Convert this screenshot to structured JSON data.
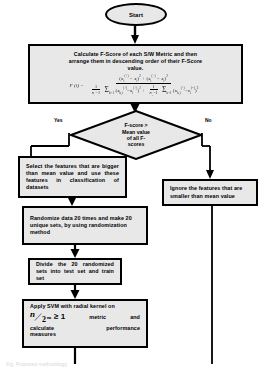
{
  "diagram": {
    "colors": {
      "node_fill": "#e8e8e8",
      "stroke": "#000000",
      "background": "#ffffff",
      "text": "#000000"
    },
    "nodes": {
      "start": {
        "label": "Start",
        "shape": "terminator"
      },
      "calculate_fscore": {
        "line1": "Calculate F-Score of each S/W Metric and then",
        "line2": "arrange them in descending order of their F-Score",
        "line3": "value.",
        "formula": {
          "lhs": "F (i) =",
          "numerator": "(x̄i(+) − x̄i)² + (x̄i(−) − x̄i)²",
          "denominator": "1/(n+ − 1) Σ (xk,i(+) − x̄i(+))² + 1/(n− − 1) Σ (xk,i(−) − x̄i(−))²"
        }
      },
      "decision": {
        "line1": "F-score >",
        "line2": "Mean value",
        "line3": "of all F-",
        "line4": "scores",
        "yes_label": "Yes",
        "no_label": "No"
      },
      "select_features": {
        "text": "Select the features that are bigger than mean value and use these features in classification of datasets"
      },
      "ignore_features": {
        "text": "Ignore the features that are smaller than mean value"
      },
      "randomize": {
        "text": "Randomize data 20 times and make 20 unique sets, by using randomization method"
      },
      "divide": {
        "text": "Divide the 20 randomized sets into test set and train set"
      },
      "apply_svm": {
        "line1": "Apply SVM with radial kernel on",
        "fraction_numerator": "n",
        "fraction_denominator": "2",
        "fraction_exponent": "m",
        "comparator": "≥ 1",
        "line2_tail_a": "metric",
        "line2_tail_b": "and",
        "line3_a": "calculate",
        "line3_b": "performance",
        "line4": "measures"
      }
    },
    "caption": "Fig. Proposed methodology"
  }
}
